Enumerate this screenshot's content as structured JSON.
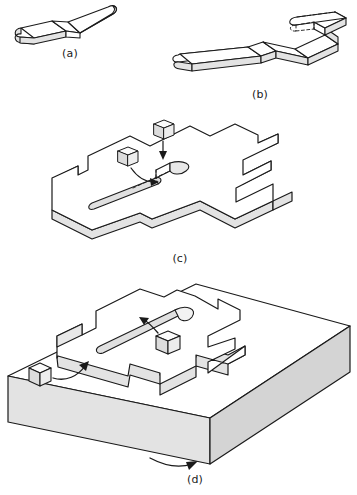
{
  "document": {
    "type": "technical-illustration",
    "title": "Isometric fabrication sequence of a castellated slotted plate",
    "background_color": "#ffffff",
    "line_color": "#1a1a1a",
    "panel_count": 4
  },
  "style": {
    "stroke": "#1a1a1a",
    "face_top": "#ffffff",
    "face_side": "#e3e3e3",
    "face_side_dark": "#d4d4d4",
    "slot_fill": "#e0e0e0",
    "cube_top": "#fbfbfb",
    "cube_side": "#dcdcdc",
    "hidden_line_style": "dashed"
  },
  "panels": [
    {
      "id": "a",
      "caption": "(a)",
      "description": "Bent flat bar with rounded ends, two segments meeting at an elbow",
      "features": [
        "rounded-end-bar",
        "elbow-bend"
      ],
      "shaded_faces": 2
    },
    {
      "id": "b",
      "caption": "(b)",
      "description": "Longer bent bar with multiple zig-zag segments and a hooked return end drawn with hidden dashed lines",
      "features": [
        "rounded-end-bar",
        "zig-zag-segments",
        "hooked-return",
        "hidden-dashed-edges"
      ],
      "segment_count": 6
    },
    {
      "id": "c",
      "caption": "(c)",
      "description": "Castellated slotted plate floating in isometric view with two small cubes and curved arrows indicating slot insertion points",
      "features": [
        "castellated-plate",
        "elongated-slot",
        "short-slot",
        "cube-callout",
        "curved-arrow",
        "hidden-dashed-centreline"
      ],
      "cube_count": 2,
      "arrow_count": 2
    },
    {
      "id": "d",
      "caption": "(d)",
      "description": "Finished castellated slotted plate seated on a thick rectangular base block, with two cubes and curved arrows indicating insertion",
      "features": [
        "base-block",
        "castellated-plate",
        "elongated-slot",
        "notch",
        "cube-callout",
        "curved-arrow"
      ],
      "cube_count": 2,
      "arrow_count": 2
    }
  ]
}
